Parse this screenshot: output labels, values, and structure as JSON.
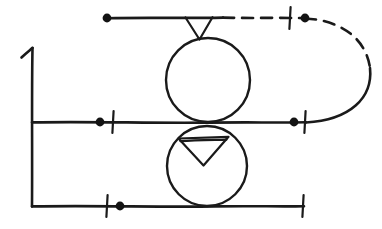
{
  "diagram": {
    "style": "hand-drawn-pen-sketch",
    "ink_color": "#1a1a1a",
    "background_color": "#ffffff",
    "canvas": {
      "width": 382,
      "height": 229
    },
    "axis": {
      "name": "vertical-axis",
      "x": 32,
      "y_top": 48,
      "y_bottom": 206,
      "arrow_flag": {
        "tip_x": 32,
        "tip_y": 48,
        "hook_x": 22,
        "hook_y": 56
      }
    },
    "lines": [
      {
        "name": "top-line",
        "y": 18,
        "x_start": 107,
        "x_end": 300,
        "solid_until_x": 222,
        "dashed_from_x": 222,
        "stroke": "solid-then-dashed"
      },
      {
        "name": "middle-line",
        "y": 122,
        "x_start": 32,
        "x_end": 305,
        "stroke": "solid"
      },
      {
        "name": "bottom-line",
        "y": 206,
        "x_start": 32,
        "x_end": 303,
        "stroke": "solid"
      }
    ],
    "return_curve": {
      "name": "dashed-return-curve",
      "from": {
        "x": 305,
        "y": 18
      },
      "to": {
        "x": 305,
        "y": 122
      },
      "bulge_x": 372,
      "stroke": "dashed-upper-solid-lower"
    },
    "circles": [
      {
        "name": "upper-circle",
        "cx": 208,
        "cy": 80,
        "r": 42
      },
      {
        "name": "lower-circle",
        "cx": 207,
        "cy": 166,
        "r": 40
      }
    ],
    "triangles": [
      {
        "name": "top-open-v-marker",
        "shape": "open-v",
        "apex": {
          "x": 199,
          "y": 39
        },
        "left": {
          "x": 185,
          "y": 17
        },
        "right": {
          "x": 212,
          "y": 17
        }
      },
      {
        "name": "lower-closed-triangle-marker",
        "shape": "closed-triangle-down",
        "apex": {
          "x": 203,
          "y": 165
        },
        "left": {
          "x": 179,
          "y": 138
        },
        "right": {
          "x": 228,
          "y": 137
        }
      }
    ],
    "dots": [
      {
        "name": "dot-top-left",
        "x": 107,
        "y": 18,
        "r": 4.4
      },
      {
        "name": "dot-top-right",
        "x": 305,
        "y": 18,
        "r": 4.4
      },
      {
        "name": "dot-middle-left",
        "x": 100,
        "y": 122,
        "r": 4.4
      },
      {
        "name": "dot-middle-right",
        "x": 294,
        "y": 122,
        "r": 4.4
      },
      {
        "name": "dot-bottom-left",
        "x": 120,
        "y": 206,
        "r": 4.4
      }
    ],
    "tick_marks": [
      {
        "name": "tick-top-right",
        "x": 290,
        "y": 18,
        "half_height": 11
      },
      {
        "name": "tick-middle-left",
        "x": 113,
        "y": 122,
        "half_height": 11
      },
      {
        "name": "tick-middle-right",
        "x": 305,
        "y": 122,
        "half_height": 11
      },
      {
        "name": "tick-bottom-left",
        "x": 107,
        "y": 206,
        "half_height": 11
      },
      {
        "name": "tick-bottom-right",
        "x": 303,
        "y": 206,
        "half_height": 11
      }
    ]
  }
}
